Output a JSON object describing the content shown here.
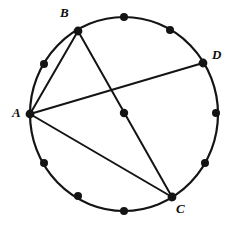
{
  "figure": {
    "kind": "circle-geometry-diagram",
    "canvas": {
      "width": 236,
      "height": 226,
      "background": "#ffffff"
    },
    "stroke_color": "#141414",
    "dot_color": "#141414",
    "circle": {
      "center_x": 124,
      "center_y": 114,
      "radius_x": 94,
      "radius_y": 97,
      "stroke_width": 2.2
    },
    "center_dot": {
      "x": 124,
      "y": 113,
      "r": 4.2,
      "label": ""
    },
    "labeled_points": [
      {
        "id": "A",
        "label": "A",
        "x": 30,
        "y": 114,
        "dot_r": 4.4,
        "label_pos": "left"
      },
      {
        "id": "B",
        "label": "B",
        "x": 78,
        "y": 31,
        "dot_r": 4.4,
        "label_pos": "top-left"
      },
      {
        "id": "C",
        "label": "C",
        "x": 172,
        "y": 197,
        "dot_r": 4.4,
        "label_pos": "bottom-right"
      },
      {
        "id": "D",
        "label": "D",
        "x": 203,
        "y": 63,
        "dot_r": 4.4,
        "label_pos": "right"
      }
    ],
    "unlabeled_points": [
      {
        "x": 124,
        "y": 17
      },
      {
        "x": 170,
        "y": 30
      },
      {
        "x": 205,
        "y": 163
      },
      {
        "x": 216,
        "y": 113
      },
      {
        "x": 172,
        "y": 197
      },
      {
        "x": 124,
        "y": 211
      },
      {
        "x": 78,
        "y": 196
      },
      {
        "x": 44,
        "y": 163
      },
      {
        "x": 44,
        "y": 64
      }
    ],
    "chords": [
      {
        "from": "A",
        "to": "B",
        "x1": 30,
        "y1": 114,
        "x2": 78,
        "y2": 31,
        "stroke_width": 2.0
      },
      {
        "from": "A",
        "to": "D",
        "x1": 30,
        "y1": 114,
        "x2": 203,
        "y2": 63,
        "stroke_width": 2.0
      },
      {
        "from": "A",
        "to": "C",
        "x1": 30,
        "y1": 114,
        "x2": 172,
        "y2": 197,
        "stroke_width": 2.0
      },
      {
        "from": "B",
        "to": "C",
        "x1": 78,
        "y1": 31,
        "x2": 172,
        "y2": 197,
        "stroke_width": 2.0
      }
    ]
  }
}
